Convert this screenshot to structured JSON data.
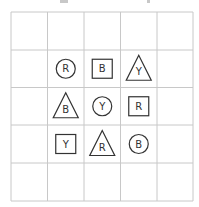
{
  "puzzle": {
    "type": "latin-square-shapes",
    "grid": {
      "rows": 5,
      "cols": 5
    },
    "line_color": "#c8c8c8",
    "shape_color": "#333333",
    "cells": [
      {
        "row": 1,
        "col": 1,
        "shape": "circle",
        "letter": "R"
      },
      {
        "row": 1,
        "col": 2,
        "shape": "square",
        "letter": "B"
      },
      {
        "row": 1,
        "col": 3,
        "shape": "triangle",
        "letter": "Y"
      },
      {
        "row": 2,
        "col": 1,
        "shape": "triangle",
        "letter": "B"
      },
      {
        "row": 2,
        "col": 2,
        "shape": "circle",
        "letter": "Y"
      },
      {
        "row": 2,
        "col": 3,
        "shape": "square",
        "letter": "R"
      },
      {
        "row": 3,
        "col": 1,
        "shape": "square",
        "letter": "Y"
      },
      {
        "row": 3,
        "col": 2,
        "shape": "triangle",
        "letter": "R"
      },
      {
        "row": 3,
        "col": 3,
        "shape": "circle",
        "letter": "B"
      }
    ]
  }
}
